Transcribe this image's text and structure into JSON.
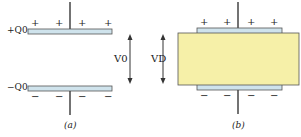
{
  "panels": [
    {
      "id": "a",
      "caption": "(a)",
      "top_charge": "+Q0",
      "bottom_charge": "−Q0",
      "voltage": "V0",
      "plus_signs": [
        "+",
        "+",
        "+",
        "+"
      ],
      "minus_signs": [
        "−",
        "−",
        "−",
        "−"
      ]
    },
    {
      "id": "b",
      "caption": "(b)",
      "voltage": "VD",
      "plus_signs": [
        "+",
        "+",
        "+",
        "+"
      ],
      "minus_signs": [
        "−",
        "−",
        "−",
        "−"
      ]
    }
  ],
  "colors": {
    "plate": "#cfe3ec",
    "plate_border": "#555555",
    "dielectric": "#f6f0a8",
    "wire": "#444444"
  }
}
